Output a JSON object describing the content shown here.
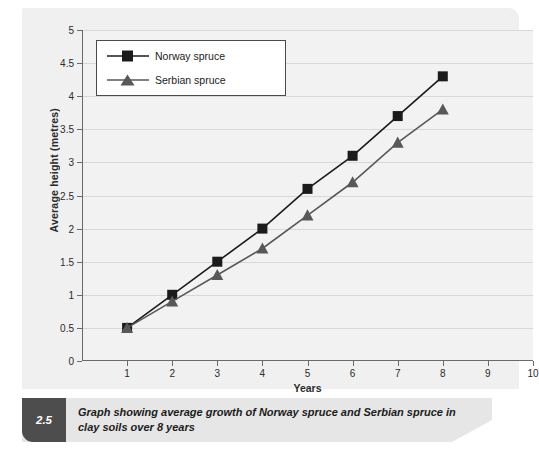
{
  "figure": {
    "caption_number": "2.5",
    "caption_text": "Graph showing average growth of Norway spruce and Serbian spruce in clay soils over 8 years"
  },
  "colors": {
    "norway_series": "#1b1b1b",
    "serbian_series": "#585858",
    "panel_background": "#f0f0f0",
    "plot_background": "#f2f2f2",
    "gridline": "#d8d8d8",
    "axis": "#6a6a6a",
    "caption_bar": "#e6e6e6",
    "caption_badge": "#4d4d4d"
  },
  "chart_data": {
    "type": "line",
    "title": "",
    "xlabel": "Years",
    "ylabel": "Average height (metres)",
    "x": [
      1,
      2,
      3,
      4,
      5,
      6,
      7,
      8
    ],
    "xticks": [
      1,
      2,
      3,
      4,
      5,
      6,
      7,
      8,
      9,
      10
    ],
    "xticklabels": [
      "1",
      "2",
      "3",
      "4",
      "5",
      "6",
      "7",
      "8",
      "9",
      "10"
    ],
    "xlim": [
      0,
      10
    ],
    "yticks": [
      0,
      0.5,
      1,
      1.5,
      2,
      2.5,
      3,
      3.5,
      4,
      4.5,
      5
    ],
    "yticklabels": [
      "0",
      "0.5",
      "1",
      "1.5",
      "2",
      "2.5",
      "3",
      "3.5",
      "4",
      "4.5",
      "5"
    ],
    "ylim": [
      0,
      5
    ],
    "grid": "horizontal",
    "legend_position": "upper left",
    "series": [
      {
        "name": "Norway spruce",
        "marker": "square",
        "color": "#1b1b1b",
        "values": [
          0.5,
          1.0,
          1.5,
          2.0,
          2.6,
          3.1,
          3.7,
          4.3
        ]
      },
      {
        "name": "Serbian spruce",
        "marker": "triangle",
        "color": "#585858",
        "values": [
          0.5,
          0.9,
          1.3,
          1.7,
          2.2,
          2.7,
          3.3,
          3.8
        ]
      }
    ]
  }
}
